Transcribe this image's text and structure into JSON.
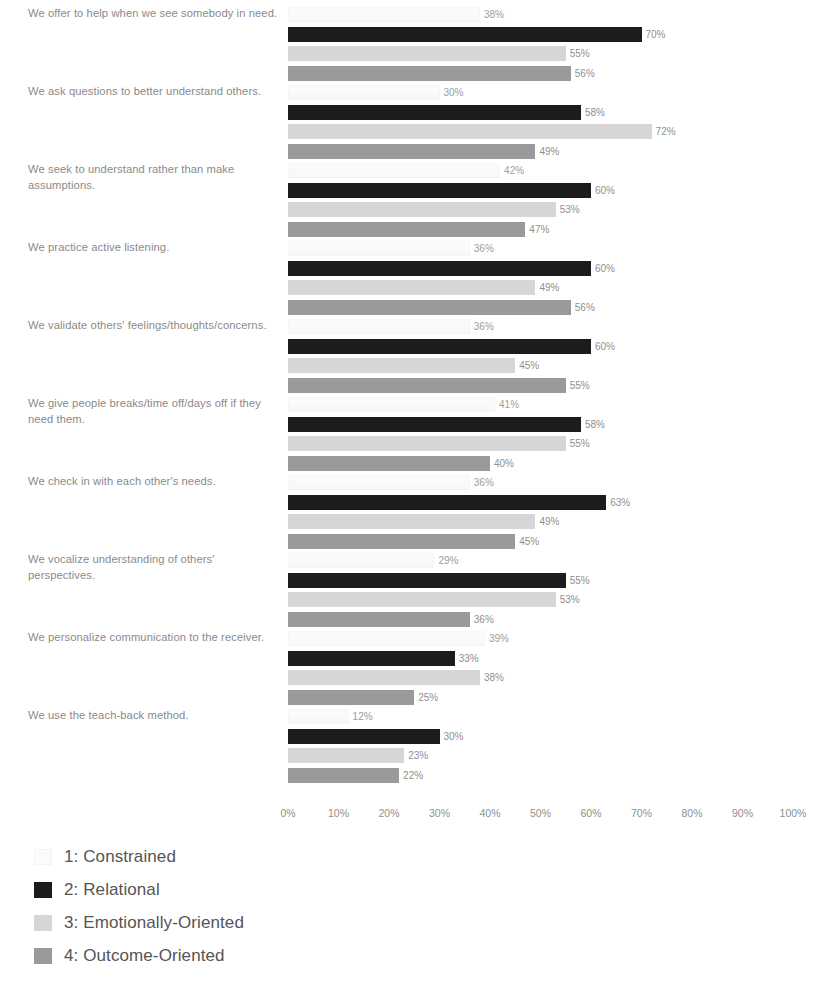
{
  "chart_data": {
    "type": "bar",
    "orientation": "horizontal",
    "grouped": true,
    "title": "",
    "subtitle": "",
    "xlabel": "",
    "ylabel": "",
    "xlim": [
      0,
      100
    ],
    "xtick_labels": [
      "0%",
      "10%",
      "20%",
      "30%",
      "40%",
      "50%",
      "60%",
      "70%",
      "80%",
      "90%",
      "100%"
    ],
    "xtick_values": [
      0,
      10,
      20,
      30,
      40,
      50,
      60,
      70,
      80,
      90,
      100
    ],
    "grid": false,
    "value_label_suffix": "%",
    "legend_position": "bottom-left",
    "categories": [
      "We offer to help when we see somebody in need.",
      "We ask questions to better understand others.",
      "We seek to understand rather than make assumptions.",
      "We practice active listening.",
      "We validate others' feelings/thoughts/concerns.",
      "We give people breaks/time off/days off if they need them.",
      "We check in with each other's needs.",
      "We vocalize understanding of others' perspectives.",
      "We personalize communication to the receiver.",
      "We use the teach-back method."
    ],
    "series": [
      {
        "name": "1: Constrained",
        "color": "#fbfbfb",
        "values": [
          38,
          30,
          42,
          36,
          36,
          41,
          36,
          29,
          39,
          12
        ],
        "value_labels": [
          "38%",
          "30%",
          "42%",
          "36%",
          "36%",
          "41%",
          "36%",
          "29%",
          "39%",
          "12%"
        ]
      },
      {
        "name": "2: Relational",
        "color": "#1c1c1c",
        "values": [
          70,
          58,
          60,
          60,
          60,
          58,
          63,
          55,
          33,
          30
        ],
        "value_labels": [
          "70%",
          "58%",
          "60%",
          "60%",
          "60%",
          "58%",
          "63%",
          "55%",
          "33%",
          "30%"
        ]
      },
      {
        "name": "3: Emotionally-Oriented",
        "color": "#d6d6d6",
        "values": [
          55,
          72,
          53,
          49,
          45,
          55,
          49,
          53,
          38,
          23
        ],
        "value_labels": [
          "55%",
          "72%",
          "53%",
          "49%",
          "45%",
          "55%",
          "49%",
          "53%",
          "38%",
          "23%"
        ]
      },
      {
        "name": "4: Outcome-Oriented",
        "color": "#9a9a9a",
        "values": [
          56,
          49,
          47,
          56,
          55,
          40,
          45,
          36,
          25,
          22
        ],
        "value_labels": [
          "56%",
          "49%",
          "47%",
          "56%",
          "55%",
          "40%",
          "45%",
          "36%",
          "25%",
          "22%"
        ]
      }
    ]
  },
  "legend": {
    "items": [
      {
        "label": "1: Constrained",
        "color": "#fbfbfb"
      },
      {
        "label": "2: Relational",
        "color": "#1c1c1c"
      },
      {
        "label": "3: Emotionally-Oriented",
        "color": "#d6d6d6"
      },
      {
        "label": "4: Outcome-Oriented",
        "color": "#9a9a9a"
      }
    ]
  }
}
